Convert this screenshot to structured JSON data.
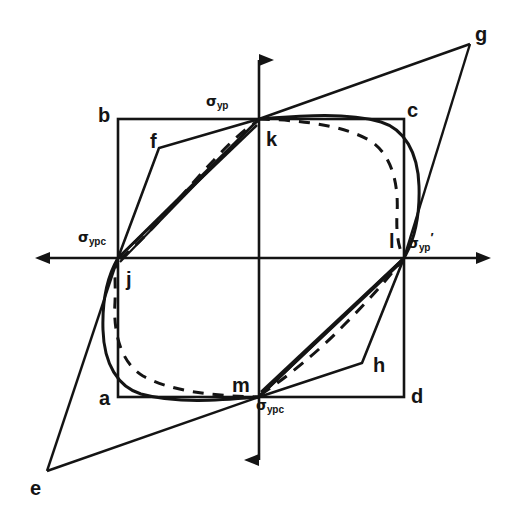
{
  "figure": {
    "kind": "engineering-diagram",
    "background_color": "#ffffff",
    "line_color": "#141414"
  },
  "axes": {
    "origin": {
      "x": 259,
      "y": 258
    },
    "horizontal": {
      "x1": 34,
      "x2": 492,
      "y": 258
    },
    "vertical": {
      "y1": 46,
      "y2": 474,
      "x": 259
    },
    "arrowheads": [
      "left",
      "right",
      "up",
      "down"
    ]
  },
  "axis_labels": [
    {
      "id": "sigma-yp-top",
      "base": "σ",
      "sub": "yp",
      "prime": "",
      "x": 206,
      "y": 94
    },
    {
      "id": "sigma-ypc-left",
      "base": "σ",
      "sub": "ypc",
      "prime": "",
      "x": 78,
      "y": 230
    },
    {
      "id": "sigma-yp-right",
      "base": "σ",
      "sub": "yp",
      "prime": "′",
      "x": 408,
      "y": 231
    },
    {
      "id": "sigma-ypc-bottom",
      "base": "σ",
      "sub": "ypc",
      "prime": "",
      "x": 256,
      "y": 398
    }
  ],
  "point_labels": [
    {
      "id": "a",
      "text": "a",
      "x": 99,
      "y": 388
    },
    {
      "id": "b",
      "text": "b",
      "x": 98,
      "y": 105
    },
    {
      "id": "c",
      "text": "c",
      "x": 407,
      "y": 100
    },
    {
      "id": "d",
      "text": "d",
      "x": 411,
      "y": 386
    },
    {
      "id": "e",
      "text": "e",
      "x": 30,
      "y": 478
    },
    {
      "id": "f",
      "text": "f",
      "x": 150,
      "y": 131
    },
    {
      "id": "g",
      "text": "g",
      "x": 475,
      "y": 24
    },
    {
      "id": "h",
      "text": "h",
      "x": 373,
      "y": 355
    },
    {
      "id": "j",
      "text": "j",
      "x": 126,
      "y": 269
    },
    {
      "id": "k",
      "text": "k",
      "x": 266,
      "y": 129
    },
    {
      "id": "l",
      "text": "l",
      "x": 389,
      "y": 231
    },
    {
      "id": "m",
      "text": "m",
      "x": 232,
      "y": 375
    }
  ],
  "geometry": {
    "rect": {
      "left": 118,
      "top": 119,
      "right": 404,
      "bottom": 397
    },
    "key_points": {
      "a": {
        "x": 118,
        "y": 397
      },
      "b": {
        "x": 118,
        "y": 119
      },
      "c": {
        "x": 404,
        "y": 119
      },
      "d": {
        "x": 404,
        "y": 397
      },
      "e": {
        "x": 47,
        "y": 471
      },
      "f": {
        "x": 159,
        "y": 148
      },
      "g": {
        "x": 470,
        "y": 44
      },
      "h": {
        "x": 362,
        "y": 363
      },
      "j": {
        "x": 118,
        "y": 258
      },
      "k": {
        "x": 259,
        "y": 119
      },
      "l": {
        "x": 404,
        "y": 258
      },
      "m": {
        "x": 259,
        "y": 397
      }
    }
  }
}
